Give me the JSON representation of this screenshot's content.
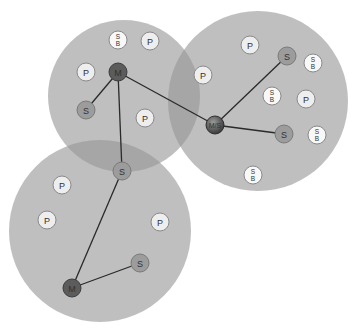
{
  "colors": {
    "piconet_fill": "#b4b4b4",
    "piconet_overlap": "#9e9e9e",
    "master": "#5c5c5c",
    "master_slave": "#4a4a4a",
    "slave": "#9c9c9c",
    "parked": "#eeeeee",
    "standby": "#f8f8f8",
    "link": "#2a2a2a"
  },
  "legend_semantics": {
    "M": "master",
    "S": "slave",
    "P": "parked",
    "SB": "standby",
    "M/S": "master/slave bridge"
  },
  "piconets": [
    {
      "id": "piconet-top-left",
      "name": "Piconet 1"
    },
    {
      "id": "piconet-right",
      "name": "Piconet 2"
    },
    {
      "id": "piconet-bottom-left",
      "name": "Piconet 3"
    }
  ],
  "nodes": [
    {
      "id": "n1",
      "type": "standby",
      "label_top": "S",
      "label_bottom": "B"
    },
    {
      "id": "n2",
      "type": "parked",
      "label": "P"
    },
    {
      "id": "n3",
      "type": "parked",
      "label": "P"
    },
    {
      "id": "n4",
      "type": "master",
      "label": "M"
    },
    {
      "id": "n5",
      "type": "slave",
      "label": "S"
    },
    {
      "id": "n6",
      "type": "parked",
      "label": "P"
    },
    {
      "id": "n7",
      "type": "parked",
      "label": "P"
    },
    {
      "id": "n8",
      "type": "slave",
      "label": "S"
    },
    {
      "id": "n9",
      "type": "parked",
      "label": "P"
    },
    {
      "id": "n10",
      "type": "slave",
      "label": "S"
    },
    {
      "id": "n11",
      "type": "standby",
      "label_top": "S",
      "label_bottom": "B"
    },
    {
      "id": "n12",
      "type": "standby",
      "label_top": "S",
      "label_bottom": "B"
    },
    {
      "id": "n13",
      "type": "parked",
      "label": "P"
    },
    {
      "id": "n14",
      "type": "master_slave",
      "label": "M/S"
    },
    {
      "id": "n15",
      "type": "slave",
      "label": "S"
    },
    {
      "id": "n16",
      "type": "standby",
      "label_top": "S",
      "label_bottom": "B"
    },
    {
      "id": "n17",
      "type": "standby",
      "label_top": "S",
      "label_bottom": "B"
    },
    {
      "id": "n18",
      "type": "parked",
      "label": "P"
    },
    {
      "id": "n19",
      "type": "parked",
      "label": "P"
    },
    {
      "id": "n20",
      "type": "parked",
      "label": "P"
    },
    {
      "id": "n21",
      "type": "slave",
      "label": "S"
    },
    {
      "id": "n22",
      "type": "master",
      "label": "M"
    }
  ],
  "links": [
    {
      "from": "n4",
      "to": "n5"
    },
    {
      "from": "n4",
      "to": "n8"
    },
    {
      "from": "n4",
      "to": "n14"
    },
    {
      "from": "n14",
      "to": "n10"
    },
    {
      "from": "n14",
      "to": "n15"
    },
    {
      "from": "n22",
      "to": "n8"
    },
    {
      "from": "n22",
      "to": "n21"
    }
  ]
}
